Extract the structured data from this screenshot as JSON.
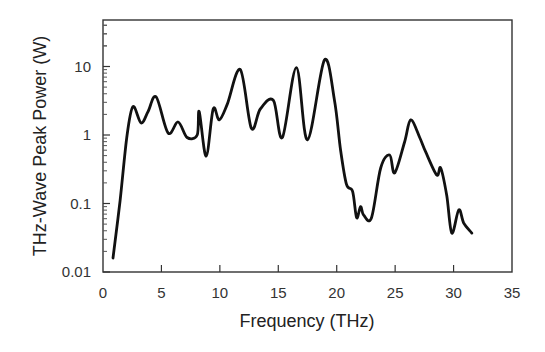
{
  "chart_data": {
    "type": "line",
    "title": "",
    "xlabel": "Frequency (THz)",
    "ylabel": "THz-Wave Peak Power (W)",
    "xlim": [
      0,
      35
    ],
    "ylim": [
      0.01,
      49
    ],
    "yscale": "log",
    "grid": false,
    "legend": null,
    "x_ticks": [
      0,
      5,
      10,
      15,
      20,
      25,
      30,
      35
    ],
    "x_tick_labels": [
      "0",
      "5",
      "10",
      "15",
      "20",
      "25",
      "30",
      "35"
    ],
    "y_ticks": [
      0.01,
      0.1,
      1,
      10
    ],
    "y_tick_labels": [
      "0.01",
      "0.1",
      "1",
      "10"
    ],
    "series": [
      {
        "name": "THz-wave peak power",
        "color": "#111111",
        "x": [
          0.86,
          1.46,
          2.06,
          2.57,
          3.26,
          3.86,
          4.55,
          5.57,
          6.43,
          7.2,
          8.06,
          8.23,
          8.83,
          9.43,
          9.95,
          10.63,
          11.75,
          12.69,
          13.46,
          14.58,
          15.35,
          16.55,
          17.5,
          18.95,
          19.81,
          20.33,
          20.84,
          21.36,
          21.7,
          22.04,
          22.3,
          22.98,
          23.76,
          24.53,
          24.96,
          25.81,
          26.33,
          27.1,
          27.62,
          28.56,
          28.9,
          29.42,
          29.85,
          30.45,
          30.87,
          31.56
        ],
        "y": [
          0.016,
          0.11,
          1.0,
          2.6,
          1.5,
          2.2,
          3.6,
          1.07,
          1.55,
          0.92,
          1.0,
          2.2,
          0.49,
          2.4,
          1.66,
          2.8,
          9.0,
          1.26,
          2.4,
          3.2,
          0.92,
          9.6,
          0.85,
          12.4,
          3.2,
          0.6,
          0.19,
          0.15,
          0.062,
          0.09,
          0.068,
          0.062,
          0.33,
          0.51,
          0.28,
          0.79,
          1.66,
          0.92,
          0.56,
          0.26,
          0.33,
          0.13,
          0.037,
          0.081,
          0.052,
          0.037
        ]
      }
    ]
  }
}
